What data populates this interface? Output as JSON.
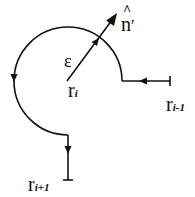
{
  "diagram": {
    "labels": {
      "epsilon": "ε",
      "r": "r",
      "r_i_sub": "i",
      "r_prev_sub": "i-1",
      "r_next_sub": "i+1",
      "normal": "n",
      "normal_hat": "^",
      "normal_prime": "′"
    },
    "colors": {
      "stroke": "#111111",
      "background": "#ffffff"
    }
  }
}
